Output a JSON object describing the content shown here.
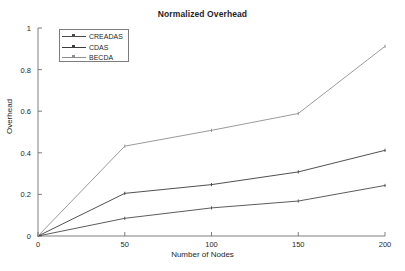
{
  "chart_data": {
    "type": "line",
    "title": "Normalized Overhead",
    "xlabel": "Number of Nodes",
    "ylabel": "Overhead",
    "x": [
      0,
      50,
      100,
      150,
      200
    ],
    "xlim": [
      0,
      200
    ],
    "ylim": [
      0,
      1
    ],
    "xticks": [
      "0",
      "50",
      "100",
      "150",
      "200"
    ],
    "yticks": [
      "0",
      "0.2",
      "0.4",
      "0.6",
      "0.8",
      "1"
    ],
    "grid": false,
    "legend_position": "upper-left",
    "series": [
      {
        "name": "CREADAS",
        "color": "#4a4a4a",
        "values": [
          0,
          0.085,
          0.135,
          0.168,
          0.243
        ]
      },
      {
        "name": "CDAS",
        "color": "#3c3c3c",
        "values": [
          0,
          0.205,
          0.247,
          0.308,
          0.412
        ]
      },
      {
        "name": "BECDA",
        "color": "#8e8e8e",
        "values": [
          0,
          0.432,
          0.508,
          0.589,
          0.912
        ]
      }
    ]
  },
  "axes": {
    "tick_color": "#6f6f6f",
    "axis_color": "#6f6f6f"
  }
}
